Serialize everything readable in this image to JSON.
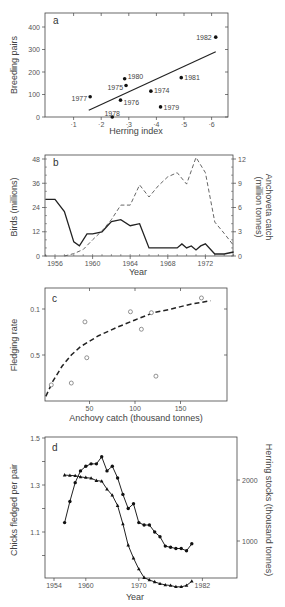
{
  "chart_data": [
    {
      "panel": "a",
      "type": "scatter",
      "xlabel": "Herring index",
      "ylabel": "Breeding pairs",
      "x_ticks": [
        "+1",
        "+2",
        "+3",
        "+4",
        "+5",
        "+6"
      ],
      "y_ticks": [
        "0",
        "100",
        "200",
        "300",
        "400"
      ],
      "xlim": [
        0,
        6.5
      ],
      "ylim": [
        0,
        450
      ],
      "grid": false,
      "points": [
        {
          "label": "1977",
          "x": 1.6,
          "y": 90
        },
        {
          "label": "1978",
          "x": 2.4,
          "y": 0
        },
        {
          "label": "1976",
          "x": 2.7,
          "y": 75
        },
        {
          "label": "1980",
          "x": 2.85,
          "y": 170
        },
        {
          "label": "1975",
          "x": 2.9,
          "y": 140
        },
        {
          "label": "1974",
          "x": 3.8,
          "y": 115
        },
        {
          "label": "1979",
          "x": 4.15,
          "y": 45
        },
        {
          "label": "1981",
          "x": 4.9,
          "y": 175
        },
        {
          "label": "1982",
          "x": 6.15,
          "y": 355
        }
      ],
      "trendline": {
        "x": [
          1.55,
          6.15
        ],
        "y": [
          30,
          290
        ]
      }
    },
    {
      "panel": "b",
      "type": "line",
      "xlabel": "Year",
      "ylabel": "Birds (millions)",
      "ylabel_right": "Anchoveta catch (million tonnes)",
      "x_ticks": [
        "1956",
        "1960",
        "1964",
        "1968",
        "1972"
      ],
      "y_ticks": [
        "0",
        "12",
        "24",
        "36",
        "48"
      ],
      "y_ticks_right": [
        "0",
        "3",
        "6",
        "9",
        "12"
      ],
      "ylim": [
        0,
        50
      ],
      "ylim_right": [
        0,
        12.5
      ],
      "grid": false,
      "series": [
        {
          "name": "Birds (millions)",
          "style": "solid",
          "axis": "left",
          "x": [
            1955,
            1956,
            1957,
            1958,
            1958.6,
            1959.4,
            1960,
            1961,
            1962,
            1963,
            1964,
            1965,
            1966,
            1967,
            1968,
            1968.5,
            1969,
            1969.5,
            1970,
            1970.5,
            1971,
            1971.5,
            1972,
            1973,
            1974,
            1975
          ],
          "values": [
            28,
            28,
            22,
            7,
            5,
            11,
            11,
            12,
            17,
            18,
            15,
            16,
            4,
            4,
            4,
            4,
            4,
            6,
            4,
            5,
            3,
            5,
            6,
            1,
            1,
            2
          ]
        },
        {
          "name": "Anchoveta catch (million tonnes)",
          "style": "dashed",
          "axis": "right",
          "x": [
            1957,
            1958,
            1959,
            1960,
            1961,
            1962,
            1963,
            1964,
            1965,
            1966,
            1967,
            1968,
            1969,
            1970,
            1971,
            1972,
            1973,
            1974,
            1975
          ],
          "values": [
            0,
            0.3,
            0.8,
            2.0,
            3.1,
            4.5,
            6.3,
            6.3,
            8.8,
            7.3,
            8.7,
            9.8,
            10.3,
            8.9,
            12.2,
            10.3,
            4.2,
            2.8,
            1.3
          ]
        }
      ]
    },
    {
      "panel": "c",
      "type": "scatter",
      "xlabel": "Anchovy catch (thousand tonnes)",
      "ylabel": "Fledging rate",
      "x_ticks": [
        "50",
        "100",
        "150"
      ],
      "y_ticks": [
        "0.5",
        "0.1"
      ],
      "grid": false,
      "marker": "open-circle",
      "points": [
        {
          "x": 8,
          "y": 0.175
        },
        {
          "x": 30,
          "y": 0.195
        },
        {
          "x": 45,
          "y": 0.86
        },
        {
          "x": 47,
          "y": 0.47
        },
        {
          "x": 95,
          "y": 0.97
        },
        {
          "x": 107,
          "y": 0.78
        },
        {
          "x": 118,
          "y": 0.96
        },
        {
          "x": 123,
          "y": 0.27
        },
        {
          "x": 173,
          "y": 1.12
        }
      ],
      "fit_curve": {
        "style": "dashed",
        "x": [
          2,
          10,
          20,
          30,
          40,
          50,
          60,
          80,
          100,
          120,
          140,
          160,
          183
        ],
        "y": [
          0.05,
          0.22,
          0.38,
          0.5,
          0.59,
          0.65,
          0.71,
          0.8,
          0.88,
          0.96,
          1.0,
          1.05,
          1.09
        ]
      }
    },
    {
      "panel": "d",
      "type": "line",
      "xlabel": "Year",
      "ylabel": "Chicks fledged per pair",
      "ylabel_right": "Herring stocks (thousand tonnes)",
      "x_ticks": [
        "1954",
        "1960",
        "1970",
        "1982"
      ],
      "y_ticks": [
        "1.1",
        "1.3",
        "1.5"
      ],
      "y_ticks_right": [
        "1000",
        "2000"
      ],
      "grid": false,
      "series": [
        {
          "name": "Chicks fledged per pair",
          "marker": "circle",
          "axis": "left",
          "x": [
            1956,
            1957,
            1958,
            1959,
            1960,
            1961,
            1962,
            1963,
            1964,
            1965,
            1966,
            1967,
            1968,
            1969,
            1970,
            1971,
            1972,
            1973,
            1974,
            1975,
            1976,
            1977,
            1978,
            1979,
            1980
          ],
          "values": [
            1.14,
            1.23,
            1.31,
            1.36,
            1.38,
            1.39,
            1.39,
            1.42,
            1.36,
            1.38,
            1.33,
            1.26,
            1.2,
            1.22,
            1.14,
            1.13,
            1.13,
            1.1,
            1.08,
            1.04,
            1.035,
            1.03,
            1.03,
            1.02,
            1.05
          ]
        },
        {
          "name": "Herring stocks (thousand tonnes)",
          "marker": "triangle",
          "axis": "right",
          "x": [
            1956,
            1957,
            1958,
            1959,
            1960,
            1961,
            1962,
            1963,
            1964,
            1965,
            1966,
            1967,
            1968,
            1969,
            1970,
            1971,
            1972,
            1973,
            1974,
            1975,
            1976,
            1977,
            1978,
            1979,
            1980
          ],
          "values": [
            2080,
            2075,
            2070,
            2050,
            2040,
            2030,
            1990,
            1980,
            1850,
            1750,
            1580,
            1280,
            930,
            720,
            540,
            400,
            360,
            330,
            300,
            280,
            270,
            250,
            250,
            270,
            340
          ]
        }
      ]
    }
  ],
  "panels": {
    "a": {
      "letter": "a",
      "xlabel": "Herring index",
      "ylabel": "Breeding pairs"
    },
    "b": {
      "letter": "b",
      "xlabel": "Year",
      "ylabel": "Birds (millions)",
      "ylabel_right_1": "Anchoveta catch",
      "ylabel_right_2": "(million tonnes)"
    },
    "c": {
      "letter": "c",
      "xlabel": "Anchovy catch (thousand tonnes)",
      "ylabel": "Fledging rate"
    },
    "d": {
      "letter": "d",
      "xlabel": "Year",
      "ylabel": "Chicks fledged per pair",
      "ylabel_right": "Herring stocks (thousand tonnes)"
    }
  }
}
